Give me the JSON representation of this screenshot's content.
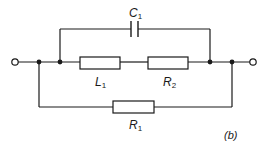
{
  "figure": {
    "label": "(b)",
    "type": "circuit-schematic"
  },
  "components": [
    {
      "id": "C1",
      "type": "capacitor",
      "letter": "C",
      "subscript": "1",
      "branch": "top"
    },
    {
      "id": "L1",
      "type": "inductor",
      "letter": "L",
      "subscript": "1",
      "branch": "middle",
      "symbol": "rectangular-box"
    },
    {
      "id": "R2",
      "type": "resistor",
      "letter": "R",
      "subscript": "2",
      "branch": "middle",
      "symbol": "rectangular-box"
    },
    {
      "id": "R1",
      "type": "resistor",
      "letter": "R",
      "subscript": "1",
      "branch": "bottom",
      "symbol": "rectangular-box"
    }
  ],
  "terminals": [
    {
      "id": "left-terminal",
      "type": "open-circle"
    },
    {
      "id": "right-terminal",
      "type": "open-circle"
    }
  ],
  "topology": "C1 in parallel with series (L1 + R2); that combination in parallel with R1",
  "colors": {
    "line": "#1a1a1a",
    "background": "#ffffff"
  }
}
